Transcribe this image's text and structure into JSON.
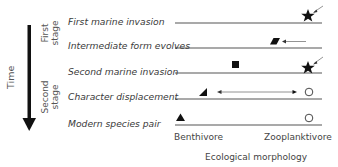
{
  "time_axis": {
    "label": "Time"
  },
  "stages": [
    {
      "label_line1": "First",
      "label_line2": "stage"
    },
    {
      "label_line1": "Second",
      "label_line2": "stage"
    }
  ],
  "rows": [
    {
      "label": "First marine invasion"
    },
    {
      "label": "Intermediate form evolves"
    },
    {
      "label": "Second marine invasion"
    },
    {
      "label": "Character displacement"
    },
    {
      "label": "Modern species pair"
    }
  ],
  "x_axis": {
    "left_label": "Benthivore",
    "right_label": "Zooplanktivore",
    "title": "Ecological morphology"
  },
  "colors": {
    "line": "#8c8c8c",
    "shape": "#111111",
    "arrow": "#777777",
    "text": "#3a3a3a"
  }
}
